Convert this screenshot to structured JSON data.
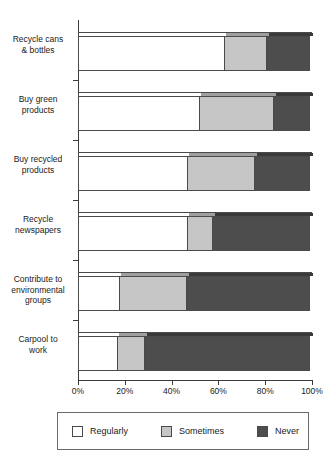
{
  "chart_data": {
    "type": "bar",
    "orientation": "horizontal",
    "stacked": true,
    "title": "",
    "xlabel": "",
    "ylabel": "",
    "xlim": [
      0,
      100
    ],
    "grid": false,
    "legend_position": "bottom",
    "categories": [
      "Recycle cans\n& bottles",
      "Buy green\nproducts",
      "Buy recycled\nproducts",
      "Recycle\nnewspapers",
      "Contribute to\nenvironmental\ngroups",
      "Carpool to\nwork"
    ],
    "series": [
      {
        "name": "Regularly",
        "color": "#ffffff",
        "values": [
          63,
          52,
          47,
          47,
          18,
          17
        ]
      },
      {
        "name": "Sometimes",
        "color": "#c6c6c6",
        "values": [
          18,
          32,
          29,
          11,
          29,
          12
        ]
      },
      {
        "name": "Never",
        "color": "#4d4d4d",
        "values": [
          19,
          16,
          24,
          42,
          53,
          71
        ]
      }
    ],
    "xticks": [
      0,
      20,
      40,
      60,
      80,
      100
    ],
    "xtick_labels": [
      "0%",
      "20%",
      "40%",
      "60%",
      "80%",
      "100%"
    ]
  },
  "legend": {
    "items": [
      {
        "label": "Regularly",
        "swatch": "regularly-swatch"
      },
      {
        "label": "Sometimes",
        "swatch": "sometimes-swatch"
      },
      {
        "label": "Never",
        "swatch": "never-swatch"
      }
    ]
  }
}
